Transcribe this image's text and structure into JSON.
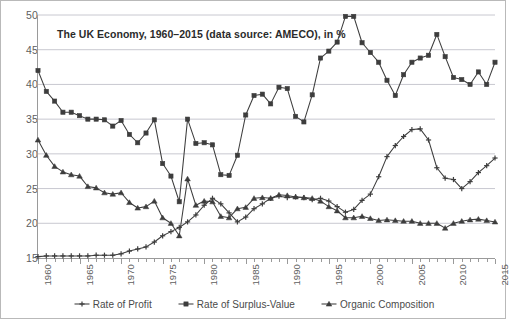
{
  "chart_data": {
    "type": "line",
    "title": "The UK Economy, 1960–2015 (data source: AMECO), in %",
    "xlabel": "",
    "ylabel": "",
    "ylim": [
      15,
      50
    ],
    "xlim": [
      1960,
      2015
    ],
    "ytick_step": 5,
    "xtick_step": 5,
    "grid": "horizontal",
    "legend_position": "bottom",
    "yticks": [
      15,
      20,
      25,
      30,
      35,
      40,
      45,
      50
    ],
    "xticks": [
      1960,
      1965,
      1970,
      1975,
      1980,
      1985,
      1990,
      1995,
      2000,
      2005,
      2010,
      2015
    ],
    "x": [
      1960,
      1961,
      1962,
      1963,
      1964,
      1965,
      1966,
      1967,
      1968,
      1969,
      1970,
      1971,
      1972,
      1973,
      1974,
      1975,
      1976,
      1977,
      1978,
      1979,
      1980,
      1981,
      1982,
      1983,
      1984,
      1985,
      1986,
      1987,
      1988,
      1989,
      1990,
      1991,
      1992,
      1993,
      1994,
      1995,
      1996,
      1997,
      1998,
      1999,
      2000,
      2001,
      2002,
      2003,
      2004,
      2005,
      2006,
      2007,
      2008,
      2009,
      2010,
      2011,
      2012,
      2013,
      2014,
      2015
    ],
    "series": [
      {
        "name": "Rate of Profit",
        "color": "#3d3d3d",
        "marker": "cross",
        "values": [
          15.2,
          15.3,
          15.3,
          15.3,
          15.3,
          15.3,
          15.3,
          15.4,
          15.4,
          15.4,
          15.6,
          16.0,
          16.3,
          16.6,
          17.3,
          18.2,
          18.8,
          19.4,
          20.2,
          21.2,
          22.6,
          23.6,
          22.8,
          21.5,
          20.2,
          20.9,
          22.1,
          22.8,
          23.6,
          23.9,
          23.7,
          23.8,
          23.7,
          23.4,
          23.6,
          23.2,
          22.4,
          21.6,
          22.0,
          23.3,
          24.2,
          26.7,
          29.6,
          31.2,
          32.5,
          33.5,
          33.6,
          32.0,
          28.0,
          26.5,
          26.3,
          25.0,
          26.0,
          27.3,
          28.3,
          29.4
        ]
      },
      {
        "name": "Rate of Surplus-Value",
        "color": "#3d3d3d",
        "marker": "square",
        "values": [
          42.0,
          39.0,
          37.6,
          36.0,
          36.0,
          35.5,
          35.0,
          35.0,
          34.9,
          34.0,
          34.8,
          32.8,
          31.6,
          33.0,
          34.9,
          28.6,
          26.8,
          23.1,
          35.0,
          31.5,
          31.6,
          31.3,
          27.0,
          26.9,
          29.8,
          35.6,
          38.4,
          38.6,
          37.2,
          39.6,
          39.4,
          35.4,
          34.6,
          38.5,
          43.8,
          44.8,
          46.1,
          49.8,
          49.8,
          46.0,
          44.6,
          43.2,
          40.6,
          38.4,
          41.4,
          43.2,
          43.8,
          44.2,
          47.2,
          44.0,
          41.0,
          40.7,
          40.0,
          41.8,
          40.0,
          43.2
        ]
      },
      {
        "name": "Organic Composition",
        "color": "#3d3d3d",
        "marker": "triangle",
        "values": [
          32.0,
          29.8,
          28.2,
          27.4,
          27.0,
          26.8,
          25.3,
          25.1,
          24.4,
          24.2,
          24.4,
          23.0,
          22.2,
          22.4,
          23.2,
          20.8,
          20.0,
          18.2,
          26.4,
          22.6,
          23.2,
          23.1,
          21.0,
          20.8,
          22.1,
          22.3,
          23.6,
          23.7,
          23.6,
          24.1,
          24.0,
          23.8,
          23.7,
          23.6,
          23.2,
          22.4,
          21.8,
          20.8,
          20.8,
          21.0,
          20.7,
          20.4,
          20.5,
          20.4,
          20.3,
          20.3,
          20.0,
          20.0,
          20.0,
          19.3,
          20.0,
          20.3,
          20.5,
          20.6,
          20.4,
          20.2
        ]
      }
    ]
  }
}
